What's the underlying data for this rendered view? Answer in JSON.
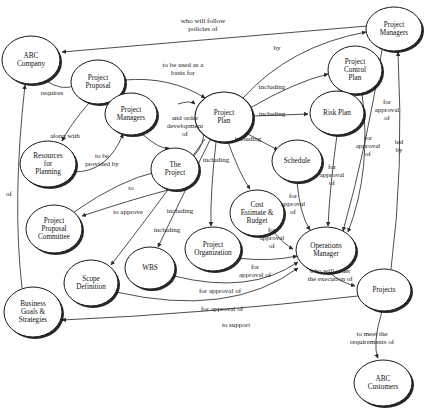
{
  "diagram": {
    "type": "concept-map",
    "style": {
      "background": "#ffffff",
      "node_fill": "#ffffff",
      "node_stroke": "#1a1a1a",
      "node_shadow": "#111111",
      "edge_stroke": "#3a3a3a",
      "text_color": "#111111"
    },
    "nodes": [
      {
        "id": "abc_company",
        "label": "ABC\nCompany",
        "cx": 31,
        "cy": 60,
        "rx": 29,
        "ry": 24
      },
      {
        "id": "project_proposal",
        "label": "Project\nProposal",
        "cx": 98,
        "cy": 82,
        "rx": 27,
        "ry": 22
      },
      {
        "id": "project_managers_l",
        "label": "Project\nManagers",
        "cx": 131,
        "cy": 114,
        "rx": 26,
        "ry": 21
      },
      {
        "id": "resources_planning",
        "label": "Resources\nfor\nPlanning",
        "cx": 48,
        "cy": 164,
        "rx": 28,
        "ry": 23
      },
      {
        "id": "the_project",
        "label": "The\nProject",
        "cx": 175,
        "cy": 169,
        "rx": 24,
        "ry": 21
      },
      {
        "id": "proposal_committee",
        "label": "Project\nProposal\nCommittee",
        "cx": 54,
        "cy": 229,
        "rx": 28,
        "ry": 24
      },
      {
        "id": "project_plan",
        "label": "Project\nPlan",
        "cx": 224,
        "cy": 117,
        "rx": 29,
        "ry": 25
      },
      {
        "id": "project_control",
        "label": "Project\nControl\nPlan",
        "cx": 355,
        "cy": 70,
        "rx": 27,
        "ry": 24
      },
      {
        "id": "project_managers_r",
        "label": "Project\nManagers",
        "cx": 394,
        "cy": 29,
        "rx": 28,
        "ry": 22
      },
      {
        "id": "risk_plan",
        "label": "Risk Plan",
        "cx": 337,
        "cy": 113,
        "rx": 27,
        "ry": 22
      },
      {
        "id": "schedule",
        "label": "Schedule",
        "cx": 297,
        "cy": 161,
        "rx": 25,
        "ry": 21
      },
      {
        "id": "cost_estimate",
        "label": "Cost\nEstimate &\nBudget",
        "cx": 257,
        "cy": 213,
        "rx": 27,
        "ry": 23
      },
      {
        "id": "project_org",
        "label": "Project\nOrganization",
        "cx": 213,
        "cy": 249,
        "rx": 28,
        "ry": 22
      },
      {
        "id": "wbs",
        "label": "WBS",
        "cx": 150,
        "cy": 268,
        "rx": 25,
        "ry": 21
      },
      {
        "id": "scope_definition",
        "label": "Scope\nDefinition",
        "cx": 91,
        "cy": 283,
        "rx": 27,
        "ry": 23
      },
      {
        "id": "business_goals",
        "label": "Business\nGoals &\nStrategies",
        "cx": 33,
        "cy": 312,
        "rx": 29,
        "ry": 25
      },
      {
        "id": "operations_manager",
        "label": "Operations\nManager",
        "cx": 326,
        "cy": 250,
        "rx": 30,
        "ry": 23
      },
      {
        "id": "projects",
        "label": "Projects",
        "cx": 384,
        "cy": 290,
        "rx": 27,
        "ry": 21
      },
      {
        "id": "abc_customers",
        "label": "ABC\nCustomers",
        "cx": 383,
        "cy": 383,
        "rx": 29,
        "ry": 23
      }
    ],
    "edges": [
      {
        "id": "e_pm_abc",
        "from": "project_managers_r",
        "to": "abc_company",
        "label": "who will follow\npolicies of",
        "lx": 203,
        "ly": 25
      },
      {
        "id": "e_abc_pp",
        "from": "abc_company",
        "to": "project_proposal",
        "label": "requires",
        "lx": 52,
        "ly": 93
      },
      {
        "id": "e_pp_plan",
        "from": "project_proposal",
        "to": "project_plan",
        "label": "to be used as a\nbasis for",
        "lx": 183,
        "ly": 69
      },
      {
        "id": "e_pp_res",
        "from": "project_proposal",
        "to": "resources_planning",
        "label": "along with",
        "lx": 65,
        "ly": 136
      },
      {
        "id": "e_res_pm",
        "from": "resources_planning",
        "to": "project_managers_l",
        "label": "to be\nprovided by",
        "lx": 102,
        "ly": 160
      },
      {
        "id": "e_pml_proj",
        "from": "project_managers_l",
        "to": "the_project",
        "label": "and order\ndevelopment\nof",
        "lx": 185,
        "ly": 126
      },
      {
        "id": "e_proj_plan",
        "from": "the_project",
        "to": "project_plan",
        "label": "",
        "lx": 0,
        "ly": 0
      },
      {
        "id": "e_committee",
        "from": "proposal_committee",
        "to": "project_proposal",
        "label": "to",
        "lx": 131,
        "ly": 188
      },
      {
        "id": "e_approve",
        "from": "the_project",
        "to": "proposal_committee",
        "label": "to approve",
        "lx": 128,
        "ly": 212
      },
      {
        "id": "e_bg_abc",
        "from": "business_goals",
        "to": "abc_company",
        "label": "of",
        "lx": 9,
        "ly": 194
      },
      {
        "id": "e_plan_pmr",
        "from": "project_plan",
        "to": "project_managers_r",
        "label": "by",
        "lx": 277,
        "ly": 48
      },
      {
        "id": "e_plan_control",
        "from": "project_plan",
        "to": "project_control",
        "label": "including",
        "lx": 272,
        "ly": 87
      },
      {
        "id": "e_plan_risk",
        "from": "project_plan",
        "to": "risk_plan",
        "label": "including",
        "lx": 272,
        "ly": 114
      },
      {
        "id": "e_plan_sched",
        "from": "project_plan",
        "to": "schedule",
        "label": "including",
        "lx": 248,
        "ly": 139
      },
      {
        "id": "e_plan_cost",
        "from": "project_plan",
        "to": "cost_estimate",
        "label": "including",
        "lx": 216,
        "ly": 160
      },
      {
        "id": "e_plan_org",
        "from": "project_plan",
        "to": "project_org",
        "label": "including",
        "lx": 180,
        "ly": 211
      },
      {
        "id": "e_plan_wbs",
        "from": "project_plan",
        "to": "wbs",
        "label": "including",
        "lx": 167,
        "ly": 230
      },
      {
        "id": "e_plan_scope",
        "from": "project_plan",
        "to": "scope_definition",
        "label": "",
        "lx": 0,
        "ly": 0
      },
      {
        "id": "e_control_om",
        "from": "project_control",
        "to": "operations_manager",
        "label": "for\napproval\nof",
        "lx": 368,
        "ly": 146
      },
      {
        "id": "e_risk_om",
        "from": "risk_plan",
        "to": "operations_manager",
        "label": "for\napproval\nof",
        "lx": 332,
        "ly": 175
      },
      {
        "id": "e_sched_om",
        "from": "schedule",
        "to": "operations_manager",
        "label": "for\napproval\nof",
        "lx": 293,
        "ly": 204
      },
      {
        "id": "e_cost_om",
        "from": "cost_estimate",
        "to": "operations_manager",
        "label": "for\napproval\nof",
        "lx": 272,
        "ly": 238
      },
      {
        "id": "e_org_om",
        "from": "project_org",
        "to": "operations_manager",
        "label": "for\napproval of",
        "lx": 255,
        "ly": 271
      },
      {
        "id": "e_wbs_om",
        "from": "wbs",
        "to": "operations_manager",
        "label": "for approval of",
        "lx": 220,
        "ly": 291
      },
      {
        "id": "e_scope_om",
        "from": "scope_definition",
        "to": "operations_manager",
        "label": "for approval of",
        "lx": 222,
        "ly": 309
      },
      {
        "id": "e_om_projects",
        "from": "operations_manager",
        "to": "projects",
        "label": "who will order\nthe execution of",
        "lx": 330,
        "ly": 275
      },
      {
        "id": "e_projects_pmr",
        "from": "projects",
        "to": "project_managers_r",
        "label": "led\nby",
        "lx": 399,
        "ly": 146
      },
      {
        "id": "e_pmr_approval",
        "from": "project_managers_r",
        "to": "operations_manager",
        "label": "for\napproval\nof",
        "lx": 387,
        "ly": 110
      },
      {
        "id": "e_projects_bg",
        "from": "projects",
        "to": "business_goals",
        "label": "to support",
        "lx": 236,
        "ly": 325
      },
      {
        "id": "e_projects_cust",
        "from": "projects",
        "to": "abc_customers",
        "label": "to meet the\nrequirements of",
        "lx": 372,
        "ly": 338
      }
    ]
  }
}
